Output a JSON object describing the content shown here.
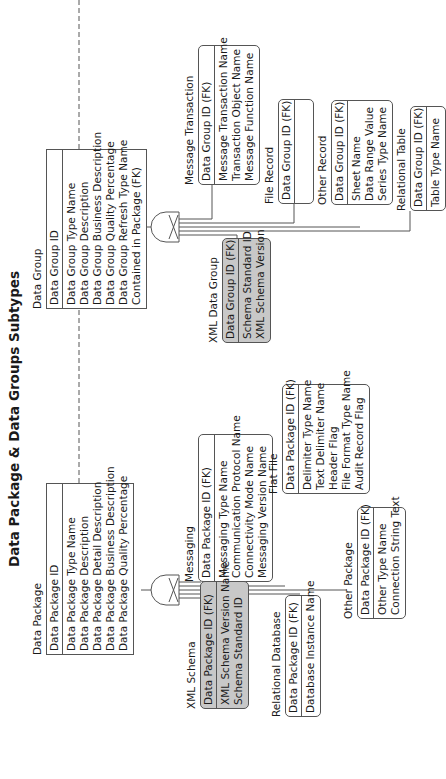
{
  "title": "Data Package & Data Groups Subtypes",
  "colors": {
    "line": "#555555",
    "shaded_entity": "#c8c8c8",
    "background": "#ffffff"
  },
  "entities": {
    "data_group": {
      "name": "Data Group",
      "key": "Data Group ID",
      "attributes": [
        "Data Group Type Name",
        "Data Group Description",
        "Data Group Business Description",
        "Data Group Quality Percentage",
        "Data Group Refresh Type Name",
        "Contained in Package (FK)"
      ]
    },
    "data_package": {
      "name": "Data Package",
      "key": "Data Package ID",
      "attributes": [
        "Data Package Type Name",
        "Data Package Description",
        "Data Package Detail Description",
        "Data Package Business Description",
        "Data Package Quality Percentage"
      ]
    },
    "message_transaction": {
      "name": "Message Transaction",
      "key": "Data Group ID (FK)",
      "attributes": [
        "Message Transaction Name",
        "Transaction Object Name",
        "Message Function Name"
      ]
    },
    "file_record": {
      "name": "File Record",
      "key": "Data Group ID (FK)",
      "attributes": []
    },
    "other_record": {
      "name": "Other Record",
      "key": "Data Group ID (FK)",
      "attributes": [
        "Sheet Name",
        "Data Range Value",
        "Series Type Name"
      ]
    },
    "relational_table": {
      "name": "Relational Table",
      "key": "Data Group ID (FK)",
      "attributes": [
        "Table Type Name"
      ]
    },
    "xml_data_group": {
      "name": "XML Data Group",
      "key": "Data Group ID (FK)",
      "attributes": [
        "Schema Standard ID",
        "XML Schema Version"
      ]
    },
    "messaging": {
      "name": "Messaging",
      "key": "Data Package ID (FK)",
      "attributes": [
        "Messaging Type Name",
        "Communication Protocol Name",
        "Connectivity Mode Name",
        "Messaging Version Name"
      ]
    },
    "flat_file": {
      "name": "Flat File",
      "key": "Data Package ID (FK)",
      "attributes": [
        "Delimiter Type Name",
        "Text Delimiter Name",
        "Header Flag",
        "File Format Type Name",
        "Audit Record Flag"
      ]
    },
    "other_package": {
      "name": "Other Package",
      "key": "Data Package ID (FK)",
      "attributes": [
        "Other Type Name",
        "Connection String Text"
      ]
    },
    "relational_database": {
      "name": "Relational Database",
      "key": "Data Package ID (FK)",
      "attributes": [
        "Database Instance Name"
      ]
    },
    "xml_schema": {
      "name": "XML Schema",
      "key": "Data Package ID (FK)",
      "attributes": [
        "XML Schema Version Name",
        "Schema Standard ID"
      ]
    }
  }
}
